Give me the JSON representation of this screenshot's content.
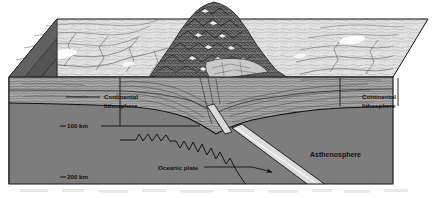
{
  "figure": {
    "labels": {
      "continental_lithosphere_left": "Continental\nlithosphere",
      "continental_lithosphere_left_line1": "Continental",
      "continental_lithosphere_left_line2": "lithosphere",
      "continental_lithosphere_right_line1": "Continental",
      "continental_lithosphere_right_line2": "lithosphere",
      "asthenosphere": "Asthenosphere",
      "oceanic_plate": "Oceanic plate",
      "depth_100": "100 km",
      "depth_200": "200 km"
    },
    "colors": {
      "surface_light": "#dcdcdc",
      "surface_highlight": "#ffffff",
      "mountain_dark": "#3a3a3a",
      "lithosphere_band": "#a8a8a8",
      "asthenosphere": "#7c7c7c",
      "side_face_dark": "#555555",
      "side_face_darker": "#4a4a4a",
      "slab_light": "#d8d8d8",
      "outline": "#121212",
      "label_text": "#111111",
      "page_background": "#ffffff"
    },
    "features": {
      "slab_label": "subducting oceanic slab",
      "trench_label": "suture / trench zone",
      "mountain_label": "collisional mountain range"
    }
  }
}
